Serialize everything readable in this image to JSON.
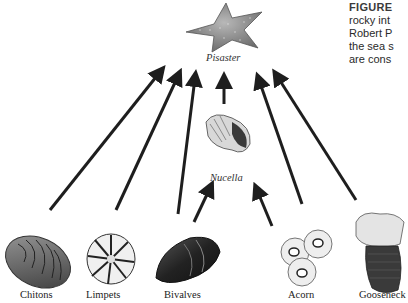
{
  "figure": {
    "caption": {
      "heading": "FIGURE",
      "lines": [
        "rocky int",
        "Robert P",
        "the sea s",
        "are cons"
      ]
    },
    "colors": {
      "arrow": "#1e1e1e",
      "background": "#ffffff"
    },
    "top_predator": {
      "label": "Pisaster",
      "icon": "starfish-icon"
    },
    "intermediate_predator": {
      "label": "Nucella",
      "icon": "whelk-shell-icon"
    },
    "prey": [
      {
        "label": "Chitons",
        "icon": "chiton-icon"
      },
      {
        "label": "Limpets",
        "icon": "limpet-icon"
      },
      {
        "label": "Bivalves",
        "icon": "mussel-icon"
      },
      {
        "label": "Acorn",
        "icon": "acorn-barnacle-icon"
      },
      {
        "label": "Gooseneck",
        "icon": "gooseneck-barnacle-icon"
      }
    ],
    "links": [
      {
        "from": "Chitons",
        "to": "Pisaster"
      },
      {
        "from": "Limpets",
        "to": "Pisaster"
      },
      {
        "from": "Bivalves",
        "to": "Pisaster"
      },
      {
        "from": "Bivalves",
        "to": "Nucella"
      },
      {
        "from": "Nucella",
        "to": "Pisaster"
      },
      {
        "from": "Acorn",
        "to": "Nucella"
      },
      {
        "from": "Acorn",
        "to": "Pisaster"
      },
      {
        "from": "Gooseneck",
        "to": "Pisaster"
      }
    ]
  }
}
